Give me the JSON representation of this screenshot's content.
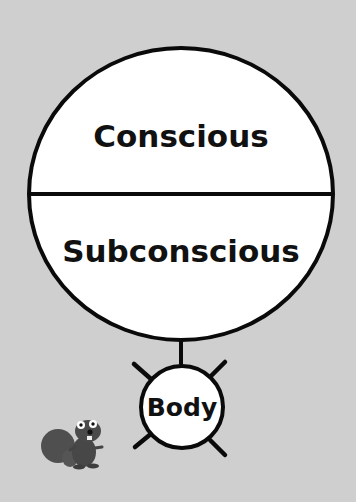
{
  "diagram": {
    "colors": {
      "background": "#cfcfcf",
      "stroke": "#0a0a0a",
      "fill": "#ffffff",
      "mascot": "#4a4a4a"
    },
    "mind": {
      "top_label": "Conscious",
      "bottom_label": "Subconscious"
    },
    "body": {
      "label": "Body"
    },
    "mascot": {
      "icon": "squirrel-icon"
    }
  }
}
